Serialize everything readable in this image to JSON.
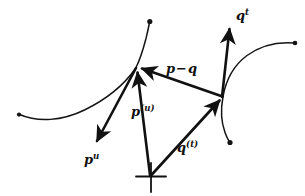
{
  "figure": {
    "kind": "hand-drawn-vector-diagram",
    "background_color": "#ffffff",
    "ink_color": "#111111",
    "width": 305,
    "height": 196
  },
  "labels": {
    "p_tangent": {
      "base": "p",
      "sup": "u",
      "text": "p u"
    },
    "p_point": {
      "base": "p",
      "sup": "(u)",
      "text": "p (u)"
    },
    "difference": {
      "base": "p",
      "op": "−",
      "base2": "q",
      "text": "p - q"
    },
    "q_point": {
      "base": "q",
      "sup": "(t)",
      "text": "q (t)"
    },
    "q_tangent": {
      "base": "q",
      "sup": "t",
      "text": "q t"
    }
  },
  "elements": {
    "origin_marker": "cross-mark",
    "curve_left": "curve-through-p",
    "curve_right": "curve-through-q",
    "vector_p": "position-vector-p",
    "vector_q": "position-vector-q",
    "vector_pq": "difference-vector-p-minus-q",
    "vector_p_tangent": "tangent-vector-p-u",
    "vector_q_tangent": "tangent-vector-q-t"
  },
  "geometry": {
    "origin": [
      150,
      176
    ],
    "point_p": [
      136,
      68
    ],
    "point_q": [
      223,
      97
    ]
  }
}
